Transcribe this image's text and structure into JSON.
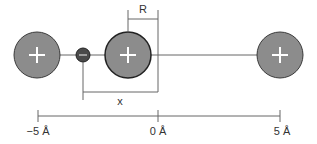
{
  "diagram": {
    "labels": {
      "radius": "R",
      "distance": "x"
    },
    "axis": {
      "ticks": [
        "−5 Å",
        "0 Å",
        "5 Å"
      ]
    },
    "particles": [
      {
        "name": "left-positive-ion",
        "charge": "+"
      },
      {
        "name": "electron",
        "charge": "−"
      },
      {
        "name": "center-positive-ion",
        "charge": "+"
      },
      {
        "name": "right-positive-ion",
        "charge": "+"
      }
    ],
    "colors": {
      "ion_fill": "#8c8c8c",
      "ion_stroke": "#3a3a3a",
      "electron_fill": "#4a4a4a",
      "line": "#666666",
      "text": "#333333"
    }
  }
}
